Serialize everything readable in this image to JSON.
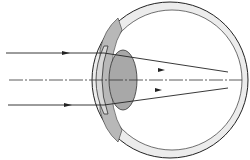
{
  "diagram": {
    "colors": {
      "line": "#222222",
      "lens": "#a8a8a8",
      "cornea": "#cfcfcf",
      "sclera": "#e6e6e6"
    },
    "rays": [
      {
        "name": "upper-ray",
        "y_in": 53
      },
      {
        "name": "optical-axis",
        "y_in": 80,
        "dashed": true
      },
      {
        "name": "lower-ray",
        "y_in": 105
      }
    ],
    "focal_point": {
      "x": 202,
      "y": 80
    }
  }
}
